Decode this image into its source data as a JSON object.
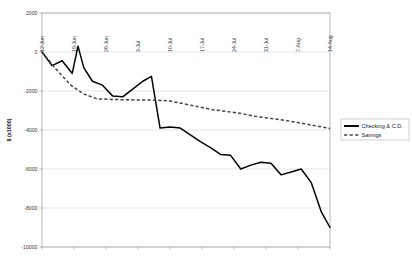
{
  "chart_data": {
    "type": "line",
    "title": "",
    "xlabel": "",
    "ylabel": "$ (x1000)",
    "ylim": [
      -10000,
      2000
    ],
    "yticks": [
      2000,
      0,
      -2000,
      -4000,
      -6000,
      -8000,
      -10000
    ],
    "ytick_labels": [
      "2000",
      "0",
      "-2000",
      "-4000",
      "-6000",
      "-8000",
      "-10000"
    ],
    "grid": true,
    "legend_position": "right",
    "categories": [
      "12-Jun",
      "19-Jun",
      "26-Jun",
      "3-Jul",
      "10-Jul",
      "17-Jul",
      "24-Jul",
      "31-Jul",
      "7-Aug",
      "14-Aug"
    ],
    "xtick_labels": [
      "12-Jun",
      "19-Jun",
      "26-Jun",
      "3-Jul",
      "10-Jul",
      "17-Jul",
      "24-Jul",
      "31-Jul",
      "7-Aug",
      "14-Aug"
    ],
    "series": [
      {
        "name": "Checking & C.D.",
        "style": "solid",
        "color": "#000000",
        "x": [
          0,
          0.35,
          0.7,
          1.05,
          1.25,
          1.45,
          1.75,
          2.1,
          2.45,
          2.8,
          3.15,
          3.5,
          3.8,
          4.1,
          4.45,
          4.8,
          5.15,
          5.5,
          5.85,
          6.2,
          6.55,
          6.9,
          7.25,
          7.6,
          7.95,
          8.3,
          8.65,
          9.0,
          9.35,
          9.7,
          10.0
        ],
        "values": [
          0,
          -700,
          -450,
          -1100,
          300,
          -800,
          -1500,
          -1700,
          -2250,
          -2300,
          -1900,
          -1500,
          -1250,
          -3900,
          -3850,
          -3900,
          -4250,
          -4600,
          -4900,
          -5250,
          -5300,
          -6000,
          -5800,
          -5650,
          -5700,
          -6300,
          -6150,
          -6000,
          -6700,
          -8200,
          -9000
        ]
      },
      {
        "name": "Savings",
        "style": "dashed",
        "color": "#444444",
        "x": [
          0,
          0.5,
          1.0,
          1.45,
          1.9,
          2.4,
          2.9,
          3.4,
          3.9,
          4.4,
          4.9,
          5.4,
          5.9,
          6.4,
          6.9,
          7.4,
          7.9,
          8.4,
          8.9,
          9.4,
          10.0
        ],
        "values": [
          0,
          -900,
          -1700,
          -2150,
          -2400,
          -2430,
          -2450,
          -2460,
          -2470,
          -2500,
          -2650,
          -2800,
          -2950,
          -3050,
          -3150,
          -3300,
          -3400,
          -3500,
          -3620,
          -3760,
          -3920
        ]
      }
    ],
    "legend": [
      {
        "label": "Checking & C.D.",
        "style": "solid",
        "color": "#000000"
      },
      {
        "label": "Savings",
        "style": "dashed",
        "color": "#444444"
      }
    ]
  }
}
